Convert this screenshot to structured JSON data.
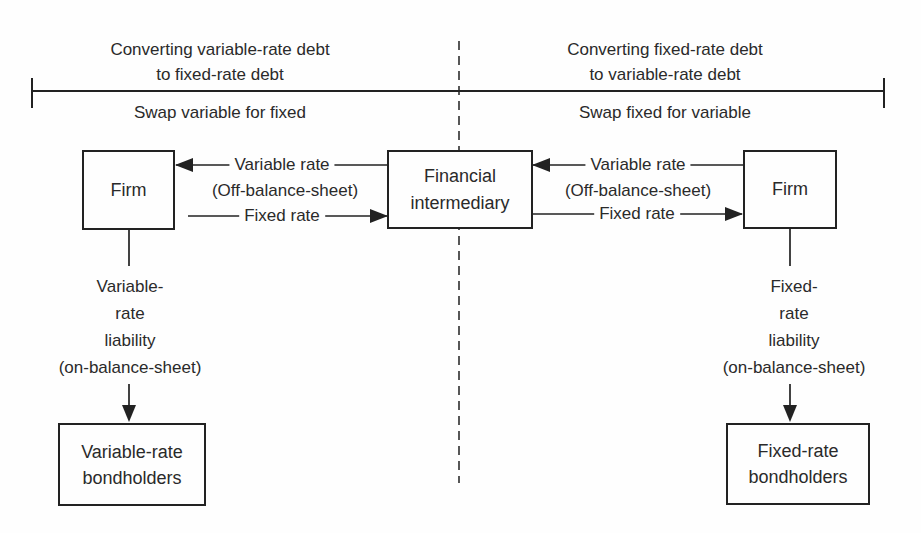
{
  "palette": {
    "background": "#fefefe",
    "ink": "#222222",
    "text": "#2a2a2a"
  },
  "top_bracket": {
    "left_section": {
      "title_line1": "Converting variable-rate debt",
      "title_line2": "to fixed-rate debt",
      "subtitle": "Swap variable for fixed"
    },
    "right_section": {
      "title_line1": "Converting fixed-rate debt",
      "title_line2": "to variable-rate debt",
      "subtitle": "Swap fixed for variable"
    }
  },
  "boxes": {
    "firm_left": {
      "label": "Firm"
    },
    "intermediary": {
      "label_line1": "Financial",
      "label_line2": "intermediary"
    },
    "firm_right": {
      "label": "Firm"
    },
    "bondholders_left": {
      "label_line1": "Variable-rate",
      "label_line2": "bondholders"
    },
    "bondholders_right": {
      "label_line1": "Fixed-rate",
      "label_line2": "bondholders"
    }
  },
  "left_swap": {
    "variable_rate": {
      "label": "Variable rate",
      "arrow_direction": "left, into Firm"
    },
    "off_balance_sheet": "(Off-balance-sheet)",
    "fixed_rate": {
      "label": "Fixed rate",
      "arrow_direction": "right, into Financial intermediary"
    }
  },
  "right_swap": {
    "variable_rate": {
      "label": "Variable rate",
      "arrow_direction": "left, into Financial intermediary"
    },
    "off_balance_sheet": "(Off-balance-sheet)",
    "fixed_rate": {
      "label": "Fixed rate",
      "arrow_direction": "right, into Firm"
    }
  },
  "left_liability": {
    "lines": [
      "Variable-",
      "rate",
      "liability",
      "(on-balance-sheet)"
    ],
    "arrow_direction": "down, into Variable-rate bondholders"
  },
  "right_liability": {
    "lines": [
      "Fixed-",
      "rate",
      "liability",
      "(on-balance-sheet)"
    ],
    "arrow_direction": "down, into Fixed-rate bondholders"
  }
}
